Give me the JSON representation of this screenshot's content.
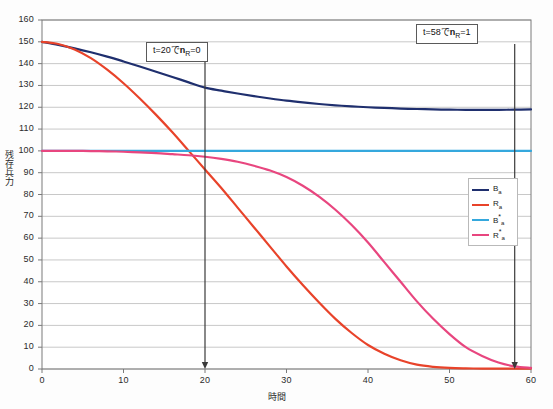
{
  "chart_data": {
    "type": "line",
    "title": "",
    "xlabel": "時間",
    "ylabel": "残存兵力",
    "xlim": [
      0,
      60
    ],
    "ylim": [
      0,
      160
    ],
    "xticks": [
      0,
      10,
      20,
      30,
      40,
      50,
      60
    ],
    "yticks": [
      0,
      10,
      20,
      30,
      40,
      50,
      60,
      70,
      80,
      90,
      100,
      110,
      120,
      130,
      140,
      150,
      160
    ],
    "grid": "horizontal",
    "legend_position": "right-middle",
    "series": [
      {
        "name": "Ba",
        "label": "B",
        "sub": "a",
        "star": "",
        "color": "#1f2f6e",
        "x": [
          0,
          2,
          4,
          6,
          8,
          10,
          12,
          14,
          16,
          18,
          20,
          22,
          24,
          26,
          28,
          30,
          32,
          34,
          36,
          38,
          40,
          42,
          44,
          46,
          48,
          50,
          52,
          54,
          56,
          58,
          60
        ],
        "y": [
          150,
          148.6,
          147.0,
          145.2,
          143.2,
          141.0,
          138.7,
          136.3,
          133.9,
          131.4,
          129.0,
          127.6,
          126.3,
          125.1,
          124.0,
          123.0,
          122.2,
          121.5,
          120.9,
          120.4,
          120.0,
          119.7,
          119.4,
          119.2,
          119.0,
          118.9,
          118.8,
          118.8,
          118.8,
          118.9,
          119.0
        ]
      },
      {
        "name": "Ra",
        "label": "R",
        "sub": "a",
        "star": "",
        "color": "#e8432a",
        "x": [
          0,
          2,
          4,
          6,
          8,
          10,
          12,
          14,
          16,
          18,
          20,
          22,
          24,
          26,
          28,
          30,
          32,
          34,
          36,
          38,
          40,
          42,
          44,
          46,
          48,
          50,
          52,
          54,
          56,
          58,
          60
        ],
        "y": [
          150,
          149.0,
          146.5,
          142.5,
          137.2,
          131.0,
          124.0,
          116.5,
          108.5,
          100.0,
          91.5,
          83.0,
          74.0,
          65.0,
          56.0,
          47.0,
          38.5,
          30.5,
          23.0,
          16.5,
          11.0,
          7.0,
          4.0,
          2.0,
          1.0,
          0.5,
          0.3,
          0.2,
          0.2,
          0.2,
          0.2
        ]
      },
      {
        "name": "B*a",
        "label": "B",
        "sub": "a",
        "star": "*",
        "color": "#35a8dd",
        "x": [
          0,
          10,
          20,
          30,
          40,
          50,
          60
        ],
        "y": [
          100,
          100,
          100,
          100,
          100,
          100,
          100
        ]
      },
      {
        "name": "R*a",
        "label": "R",
        "sub": "a",
        "star": "*",
        "color": "#e8467f",
        "x": [
          0,
          2,
          4,
          6,
          8,
          10,
          12,
          14,
          16,
          18,
          20,
          22,
          24,
          26,
          28,
          30,
          32,
          34,
          36,
          38,
          40,
          42,
          44,
          46,
          48,
          50,
          52,
          54,
          56,
          58,
          60
        ],
        "y": [
          100,
          100,
          100,
          99.9,
          99.8,
          99.6,
          99.3,
          99.0,
          98.5,
          98.0,
          97.3,
          96.3,
          95.0,
          93.2,
          91.0,
          88.0,
          84.0,
          79.0,
          73.0,
          66.0,
          58.0,
          49.0,
          40.0,
          31.0,
          23.0,
          16.0,
          10.0,
          6.0,
          3.0,
          1.2,
          0.5
        ]
      }
    ],
    "annotations": [
      {
        "id": "callout-1",
        "text_pre": "t=20で",
        "text_bold": "n",
        "text_sub": "R",
        "text_post": "=0",
        "marker_x": 20,
        "marker_kind": "down-arrow-to-axis"
      },
      {
        "id": "callout-2",
        "text_pre": "t=58で",
        "text_bold": "n",
        "text_sub": "R",
        "text_post": "=1",
        "marker_x": 58,
        "marker_kind": "down-arrow-to-axis"
      }
    ],
    "colors": {
      "grid": "#c8c8c8",
      "axis": "#7a7a7a",
      "annotation_line": "#3a3a3a",
      "plot_background": "#ffffff"
    }
  }
}
